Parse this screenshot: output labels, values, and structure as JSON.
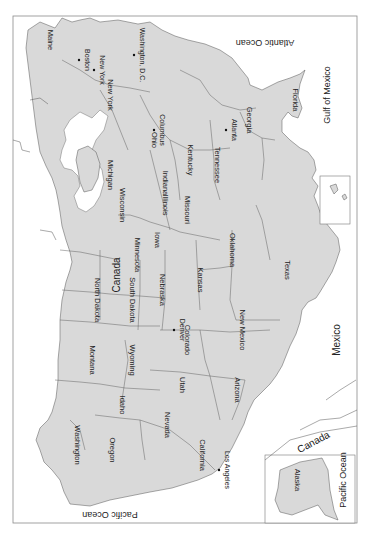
{
  "map": {
    "orientation": "rotated 90deg clockwise (north faces left)",
    "countries": [
      {
        "label": "Canada",
        "x": 120,
        "y": 275,
        "rotate": -90
      },
      {
        "label": "Mexico",
        "x": 340,
        "y": 340,
        "rotate": -90
      },
      {
        "label": "Canada",
        "x": 315,
        "y": 445,
        "rotate": -28
      }
    ],
    "oceans": [
      {
        "label": "Atlantic Ocean",
        "x": 265,
        "y": 40,
        "rotate": 180
      },
      {
        "label": "Gulf of Mexico",
        "x": 330,
        "y": 95,
        "rotate": -90
      },
      {
        "label": "Pacific Ocean",
        "x": 110,
        "y": 512,
        "rotate": 180
      },
      {
        "label": "Pacific Ocean",
        "x": 346,
        "y": 480,
        "rotate": -90
      }
    ],
    "states": [
      {
        "label": "Maine",
        "x": 48,
        "y": 40
      },
      {
        "label": "New York",
        "x": 108,
        "y": 95
      },
      {
        "label": "Michigan",
        "x": 108,
        "y": 175
      },
      {
        "label": "Ohio",
        "x": 152,
        "y": 140
      },
      {
        "label": "Indiana",
        "x": 163,
        "y": 183
      },
      {
        "label": "Illinois",
        "x": 163,
        "y": 205
      },
      {
        "label": "Wisconsin",
        "x": 120,
        "y": 205
      },
      {
        "label": "Kentucky",
        "x": 188,
        "y": 160
      },
      {
        "label": "Tennessee",
        "x": 215,
        "y": 165
      },
      {
        "label": "Georgia",
        "x": 247,
        "y": 120
      },
      {
        "label": "Florida",
        "x": 293,
        "y": 100
      },
      {
        "label": "Minnesota",
        "x": 135,
        "y": 255
      },
      {
        "label": "Iowa",
        "x": 155,
        "y": 240
      },
      {
        "label": "Missouri",
        "x": 185,
        "y": 210
      },
      {
        "label": "North Dakota",
        "x": 95,
        "y": 300
      },
      {
        "label": "South Dakota",
        "x": 130,
        "y": 300
      },
      {
        "label": "Nebraska",
        "x": 160,
        "y": 290
      },
      {
        "label": "Kansas",
        "x": 198,
        "y": 280
      },
      {
        "label": "Oklahoma",
        "x": 230,
        "y": 250
      },
      {
        "label": "Texas",
        "x": 285,
        "y": 270
      },
      {
        "label": "Montana",
        "x": 90,
        "y": 360
      },
      {
        "label": "Wyoming",
        "x": 130,
        "y": 360
      },
      {
        "label": "Colorado",
        "x": 185,
        "y": 340
      },
      {
        "label": "New Mexico",
        "x": 240,
        "y": 330
      },
      {
        "label": "Idaho",
        "x": 120,
        "y": 405
      },
      {
        "label": "Utah",
        "x": 180,
        "y": 385
      },
      {
        "label": "Arizona",
        "x": 235,
        "y": 390
      },
      {
        "label": "Nevada",
        "x": 165,
        "y": 425
      },
      {
        "label": "Washington",
        "x": 75,
        "y": 445
      },
      {
        "label": "Oregon",
        "x": 110,
        "y": 450
      },
      {
        "label": "California",
        "x": 200,
        "y": 455
      },
      {
        "label": "Alaska",
        "x": 295,
        "y": 480
      }
    ],
    "major_cities": [
      {
        "label": "Boston",
        "x": 85,
        "y": 60
      },
      {
        "label": "New York",
        "x": 100,
        "y": 70
      },
      {
        "label": "Washington, D.C.",
        "x": 140,
        "y": 55
      },
      {
        "label": "Columbus",
        "x": 160,
        "y": 130
      },
      {
        "label": "Atlanta",
        "x": 232,
        "y": 130
      },
      {
        "label": "Denver",
        "x": 180,
        "y": 330
      },
      {
        "label": "Los Angeles",
        "x": 225,
        "y": 470
      }
    ],
    "cities": [
      "Augusta",
      "Bangor",
      "Portland",
      "Concord",
      "Montpelier",
      "Burlington",
      "Albany",
      "Syracuse",
      "Buffalo",
      "Providence",
      "Hartford",
      "New Haven",
      "Newark",
      "Trenton",
      "Dover",
      "Annapolis",
      "Baltimore",
      "Philadelphia",
      "Harrisburg",
      "Pittsburgh",
      "Richmond",
      "Norfolk",
      "Virginia Beach",
      "Raleigh",
      "Greensboro",
      "Charlotte",
      "Wilmington",
      "Columbia",
      "Charleston",
      "Savannah",
      "Macon",
      "Jacksonville",
      "Daytona Beach",
      "Orlando",
      "Tampa",
      "St. Petersburg",
      "West Palm Beach",
      "Fort Lauderdale",
      "Miami",
      "Tallahassee",
      "Pensacola",
      "Montgomery",
      "Birmingham",
      "Mobile",
      "Jackson",
      "New Orleans",
      "Baton Rouge",
      "Lafayette",
      "Shreveport",
      "Little Rock",
      "Fort Smith",
      "Memphis",
      "Nashville",
      "Knoxville",
      "Chattanooga",
      "Louisville",
      "Frankfort",
      "Lexington",
      "Cincinnati",
      "Dayton",
      "Cleveland",
      "Toledo",
      "Detroit",
      "Lansing",
      "Grand Rapids",
      "Fort Wayne",
      "Indianapolis",
      "South Bend",
      "Chicago",
      "Springfield",
      "Peoria",
      "Milwaukee",
      "Madison",
      "Green Bay",
      "Duluth",
      "Minneapolis",
      "Saint Paul",
      "Rochester",
      "Des Moines",
      "Cedar Rapids",
      "Sioux City",
      "Sioux Falls",
      "Omaha",
      "Lincoln",
      "Kansas City",
      "Jefferson City",
      "St. Louis",
      "Topeka",
      "Wichita",
      "Tulsa",
      "Oklahoma City",
      "Dallas",
      "Fort Worth",
      "Waco",
      "Austin",
      "San Antonio",
      "Houston",
      "Corpus Christi",
      "Laredo",
      "El Paso",
      "Lubbock",
      "Amarillo",
      "Abilene",
      "Midland",
      "Odessa",
      "Beaumont",
      "Lake Charles",
      "Fargo",
      "Bismarck",
      "Pierre",
      "Rapid City",
      "Cheyenne",
      "Casper",
      "Billings",
      "Great Falls",
      "Helena",
      "Boise",
      "Twin Falls",
      "Salt Lake City",
      "Provo",
      "Colorado Springs",
      "Pueblo",
      "Santa Fe",
      "Albuquerque",
      "Las Cruces",
      "Phoenix",
      "Tucson",
      "Yuma",
      "Las Vegas",
      "Carson City",
      "Reno",
      "Sacramento",
      "San Francisco",
      "Oakland",
      "San Jose",
      "Fresno",
      "Bakersfield",
      "Santa Barbara",
      "Santa Maria",
      "Oxnard",
      "San Diego",
      "Barstow",
      "Redding",
      "Eugene",
      "Salem",
      "Portland",
      "Olympia",
      "Seattle",
      "Everett",
      "Bellingham",
      "Spokane",
      "Yakima",
      "Honolulu",
      "Fairbanks",
      "Anchorage",
      "Juneau"
    ],
    "insets": [
      {
        "name": "Hawaii",
        "labels": [
          "Honolulu",
          "Hawaii",
          "Pacific Ocean"
        ]
      },
      {
        "name": "Alaska",
        "labels": [
          "Fairbanks",
          "Alaska",
          "Anchorage",
          "Canada",
          "Pacific Ocean"
        ]
      }
    ],
    "other_labels": [
      "The Bahamas",
      "Lake Superior",
      "Lake Michigan",
      "Lake Huron",
      "Lake Erie",
      "Lake Ontario"
    ]
  },
  "colors": {
    "land": "#d9d9d9",
    "water": "#ffffff",
    "border": "#555555",
    "frame": "#8a8a8a"
  }
}
